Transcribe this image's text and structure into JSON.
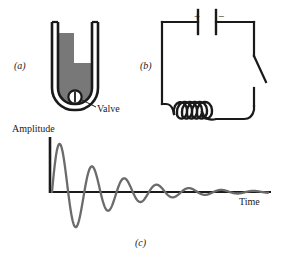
{
  "figure": {
    "panels": [
      {
        "id": "a",
        "label": "(a)",
        "caption": "U-tube manometer with fluid and valve"
      },
      {
        "id": "b",
        "label": "(b)",
        "caption": "Circuit with battery, open switch and inductor coil"
      },
      {
        "id": "c",
        "label": "(c)",
        "caption": "Damped oscillation amplitude versus time"
      }
    ],
    "panel_a": {
      "label": "(a)",
      "annotation_label": "Valve",
      "tube_color": "#1a1a1a",
      "fluid_color": "#787878",
      "valve_fill": "#ffffff",
      "left_arm_fluid_level_y": 33,
      "right_arm_fluid_level_y": 63
    },
    "panel_b": {
      "label": "(b)",
      "battery_plus": "+",
      "battery_minus": "−",
      "wire_color": "#1a1a1a",
      "coil_turns": 6,
      "switch_state": "open"
    },
    "panel_c": {
      "label": "(c)",
      "y_axis_label": "Amplitude",
      "x_axis_label": "Time",
      "axis_color": "#1a1a1a",
      "curve_color": "#6b6b6b"
    }
  },
  "chart_data": {
    "type": "line",
    "title": "",
    "xlabel": "Time",
    "ylabel": "Amplitude",
    "xlim": [
      0,
      10
    ],
    "ylim": [
      -1.05,
      1.05
    ],
    "grid": false,
    "legend": null,
    "series": [
      {
        "name": "damped oscillation",
        "function": "A*exp(-k*t)*sin(w*t)",
        "amplitude": 1.0,
        "decay_constant": 0.42,
        "angular_frequency": 4.2,
        "x": [
          0.0,
          0.25,
          0.5,
          0.75,
          1.0,
          1.25,
          1.5,
          1.75,
          2.0,
          2.25,
          2.5,
          2.75,
          3.0,
          3.25,
          3.5,
          3.75,
          4.0,
          4.25,
          4.5,
          4.75,
          5.0,
          5.25,
          5.5,
          5.75,
          6.0,
          6.25,
          6.5,
          6.75,
          7.0,
          7.25,
          7.5,
          7.75,
          8.0,
          8.25,
          8.5,
          8.75,
          9.0,
          9.25,
          9.5,
          9.75,
          10.0
        ],
        "y": [
          0.0,
          0.77,
          0.89,
          0.33,
          -0.43,
          -0.82,
          -0.64,
          -0.03,
          0.53,
          0.7,
          0.44,
          -0.06,
          -0.42,
          -0.53,
          -0.3,
          0.06,
          0.32,
          0.39,
          0.2,
          -0.07,
          -0.24,
          -0.28,
          -0.13,
          0.06,
          0.17,
          0.19,
          0.08,
          -0.06,
          -0.12,
          -0.13,
          -0.05,
          0.05,
          0.09,
          0.09,
          0.03,
          -0.04,
          -0.06,
          -0.06,
          -0.02,
          0.02,
          0.04
        ]
      }
    ]
  }
}
